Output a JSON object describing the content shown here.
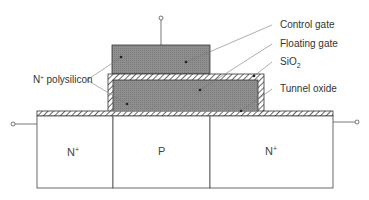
{
  "diagram": {
    "labels": {
      "control_gate": "Control gate",
      "floating_gate": "Floating gate",
      "sio2": "SiO",
      "sio2_sub": "2",
      "tunnel_oxide": "Tunnel oxide",
      "n_polysilicon": "N",
      "n_polysilicon_sup": "+",
      "n_polysilicon_rest": " polysilicon"
    },
    "regions": {
      "source": {
        "label": "N",
        "sup": "+"
      },
      "channel": {
        "label": "P"
      },
      "drain": {
        "label": "N",
        "sup": "+"
      }
    },
    "colors": {
      "gate_fill": "#8a8a8a",
      "outline": "#333333",
      "leader": "#666666",
      "background": "#ffffff"
    }
  }
}
